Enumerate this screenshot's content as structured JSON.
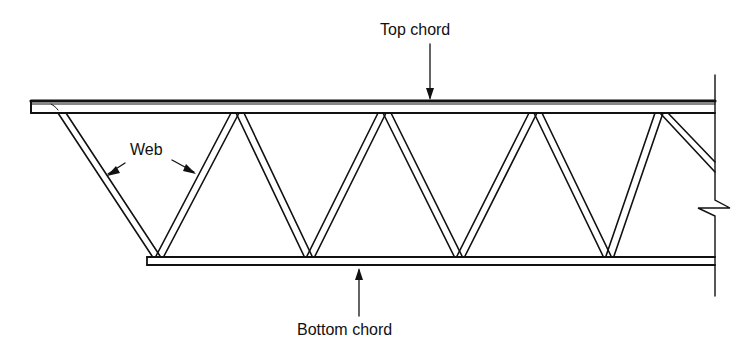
{
  "diagram": {
    "type": "open-web steel joist (truss) elevation",
    "labels": {
      "top_chord": "Top chord",
      "bottom_chord": "Bottom chord",
      "web": "Web"
    },
    "colors": {
      "line": "#111111",
      "background": "#ffffff"
    },
    "geometry": {
      "top_chord": {
        "x1": 31,
        "x2": 715,
        "y_top": 101,
        "y_bottom": 113
      },
      "bottom_chord": {
        "x1": 147,
        "x2": 715,
        "y_top": 257,
        "y_bottom": 265
      },
      "web_top_nodes_x": [
        60,
        236,
        383,
        534,
        660
      ],
      "web_bottom_nodes_x": [
        158,
        309,
        459,
        608
      ],
      "wall": {
        "x": 715,
        "y1": 75,
        "y2": 296,
        "break_y": 208
      }
    }
  }
}
